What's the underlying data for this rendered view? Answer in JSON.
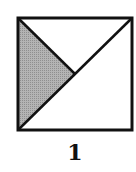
{
  "diagram": {
    "caption": "1",
    "square": {
      "x1": 17,
      "y1": 17,
      "x2": 133,
      "y2": 131
    },
    "center": {
      "x": 75,
      "y": 74
    },
    "lines": [
      {
        "name": "diagonal",
        "from": "bottom-left",
        "to": "top-right"
      },
      {
        "name": "half-diagonal",
        "from": "top-left",
        "to": "center"
      }
    ],
    "shaded_region": {
      "shape": "triangle",
      "vertices": [
        "top-left",
        "center",
        "bottom-left"
      ],
      "fill": "#a8a8a8"
    },
    "stroke_color": "#111111",
    "background_color": "#ffffff"
  }
}
